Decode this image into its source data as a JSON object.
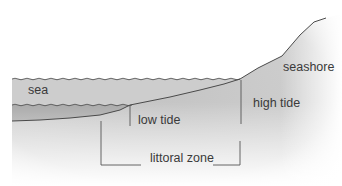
{
  "diagram": {
    "type": "cross-section",
    "labels": {
      "sea": "sea",
      "seashore": "seashore",
      "low_tide": "low tide",
      "high_tide": "high tide",
      "littoral_zone": "littoral zone"
    },
    "colors": {
      "background": "#ffffff",
      "land_fill": "#c9c9c9",
      "shading_dark": "#bdbdbd",
      "high_water_fill": "#cdcdcd",
      "low_water_fill": "#a9a9a9",
      "line": "#4a4a4a",
      "text": "#3a3a3a"
    }
  }
}
